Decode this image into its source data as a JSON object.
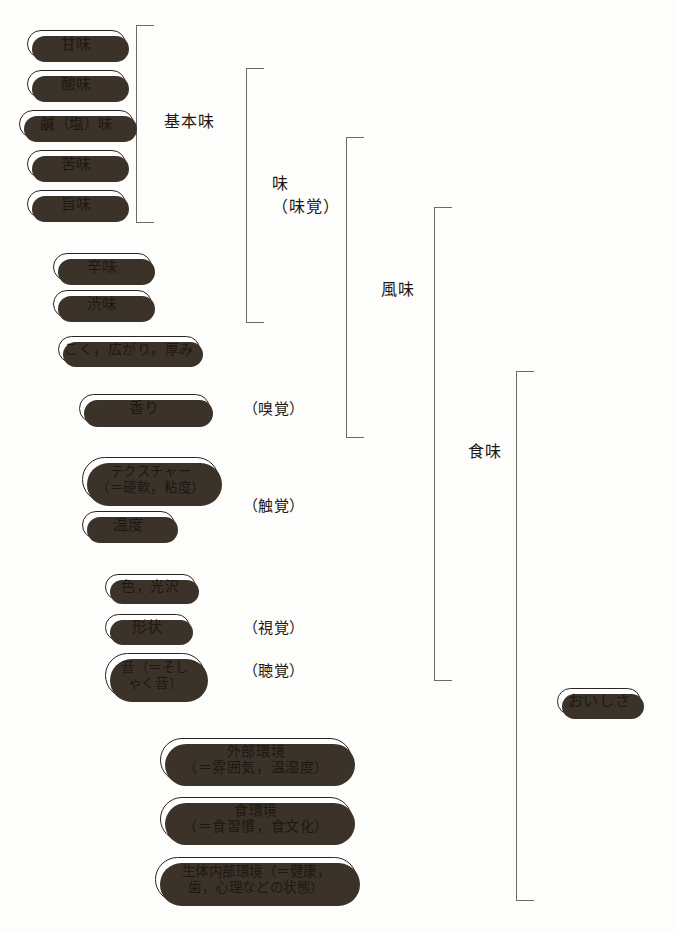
{
  "diagram": {
    "background_color": "#fdfdfb",
    "pill_border_color": "#2a241e",
    "pill_shadow_color": "#3b332a",
    "bracket_color": "#6e6a62",
    "text_color": "#1d1813"
  },
  "pills": {
    "amami": "甘味",
    "sanmi": "酸味",
    "kanmi_shio": "鹹（塩）味",
    "nigami": "苦味",
    "umami": "旨味",
    "karami": "辛味",
    "shibumi": "渋味",
    "koku": "こく，広がり，厚み",
    "kaori": "香り",
    "texture": "テクスチャー\n（＝硬軟，粘度）",
    "ondo": "温度",
    "iro_kotaku": "色，光沢",
    "keijou": "形状",
    "oto": "音（＝そし\nゃく音）",
    "gaibu_kankyou": "外部環境\n（＝雰囲気，温湿度）",
    "shoku_kankyou": "食環境\n（＝食習慣，食文化）",
    "seitai_naibu": "生体内部環境（＝健康，\n歯，心理などの状態）",
    "oishisa": "おいしさ"
  },
  "group_labels": {
    "kihonmi": "基本味",
    "aji": "味\n（味覚）",
    "fuumi": "風味",
    "shokumi": "食味"
  },
  "sense_labels": {
    "kyuukaku": "（嗅覚）",
    "shokkaku": "（触覚）",
    "shikaku": "（視覚）",
    "choukaku": "（聴覚）"
  }
}
